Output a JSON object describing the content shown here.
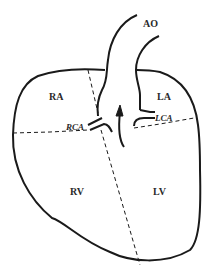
{
  "diagram": {
    "type": "heart-anatomy-schematic",
    "labels": {
      "ao": "AO",
      "ra": "RA",
      "la": "LA",
      "rca": "RCA",
      "lca": "LCA",
      "rv": "RV",
      "lv": "LV"
    },
    "colors": {
      "stroke": "#1a1a1a",
      "background": "#ffffff",
      "text": "#2a2a2a"
    }
  }
}
